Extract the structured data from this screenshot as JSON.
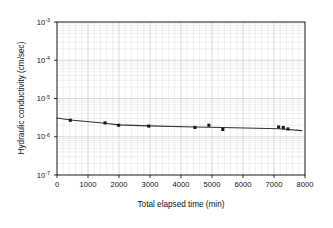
{
  "chart_data": {
    "type": "scatter",
    "title": "",
    "xlabel": "Total elapsed time (min)",
    "ylabel": "Hydraulic conductivity (cm/sec)",
    "xlim": [
      0,
      8000
    ],
    "ylim": [
      1e-07,
      0.001
    ],
    "yscale": "log",
    "xscale": "linear",
    "grid": true,
    "grid_minor": true,
    "legend": "none",
    "xticks": [
      0,
      1000,
      2000,
      3000,
      4000,
      5000,
      6000,
      7000,
      8000
    ],
    "xticklabels": [
      "0",
      "1000",
      "2000",
      "3000",
      "4000",
      "5000",
      "6000",
      "7000",
      "8000"
    ],
    "yticks": [
      0.001,
      0.0001,
      1e-05,
      1e-06,
      1e-07
    ],
    "yticklabels": [
      "10-3",
      "10-4",
      "10-5",
      "10-6",
      "10-7"
    ],
    "ytick_mantissa": "10",
    "ytick_exponents": [
      "-3",
      "-4",
      "-5",
      "-6",
      "-7"
    ],
    "series": [
      {
        "name": "Hydraulic conductivity measurements",
        "marker": "square",
        "marker_color": "#1a1a1a",
        "x": [
          430,
          1550,
          1990,
          2960,
          4450,
          4900,
          5350,
          7150,
          7300,
          7450
        ],
        "y": [
          2.7e-06,
          2.3e-06,
          2e-06,
          1.9e-06,
          1.75e-06,
          2e-06,
          1.55e-06,
          1.8e-06,
          1.75e-06,
          1.6e-06
        ]
      },
      {
        "name": "Trend line",
        "type": "line",
        "line_color": "#333333",
        "x": [
          0,
          430,
          1550,
          1990,
          2960,
          4450,
          5350,
          7150,
          7900
        ],
        "y": [
          3.1e-06,
          2.75e-06,
          2.25e-06,
          2.05e-06,
          1.92e-06,
          1.8e-06,
          1.75e-06,
          1.62e-06,
          1.45e-06
        ]
      }
    ]
  },
  "figure": {
    "xlabel": "Total elapsed time (min)",
    "ylabel": "Hydraulic conductivity (cm/sec)",
    "xticklabels": [
      "0",
      "1000",
      "2000",
      "3000",
      "4000",
      "5000",
      "6000",
      "7000",
      "8000"
    ],
    "ytick_base": "10",
    "ytick_exponents": [
      "-3",
      "-4",
      "-5",
      "-6",
      "-7"
    ],
    "colors": {
      "background": "#ffffff",
      "axis": "#000000",
      "grid_minor": "#d8d8d8",
      "grid_major": "#bdbdbd",
      "marker": "#1a1a1a",
      "line": "#333333",
      "text": "#111111"
    }
  }
}
